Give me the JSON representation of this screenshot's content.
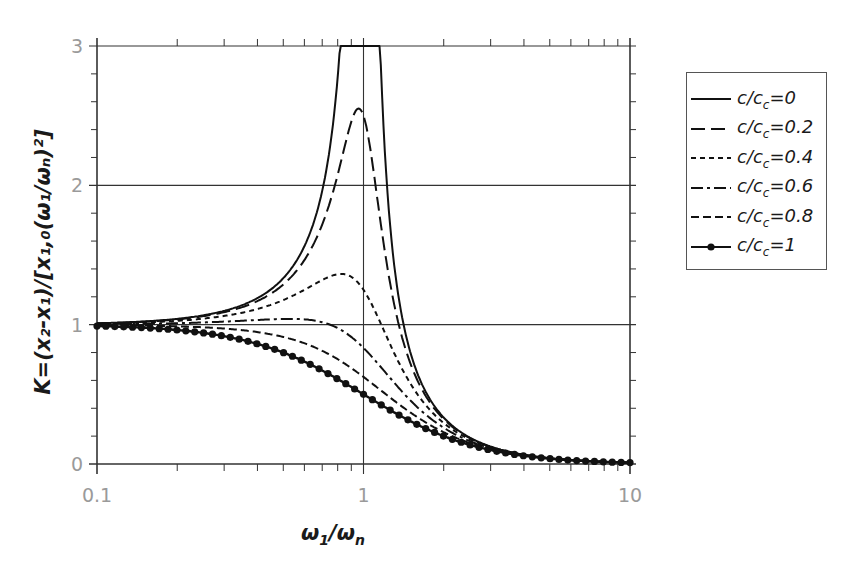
{
  "chart_data": {
    "type": "line",
    "title": "",
    "xlabel": "ω1/ωn",
    "ylabel": "K=(x2-x1)/[x1,0(ω1/ωn)²]",
    "xscale": "log",
    "xlim": [
      0.1,
      10
    ],
    "ylim": [
      0,
      3
    ],
    "xticks": [
      "0.1",
      "1",
      "10"
    ],
    "yticks": [
      "0",
      "1",
      "2",
      "3"
    ],
    "grid": true,
    "legend_position": "right-outside",
    "x": [
      0.1,
      0.15,
      0.2,
      0.3,
      0.4,
      0.5,
      0.6,
      0.7,
      0.8,
      0.85,
      0.9,
      0.95,
      1.0,
      1.05,
      1.1,
      1.2,
      1.3,
      1.5,
      2.0,
      3.0,
      5.0,
      10.0
    ],
    "series": [
      {
        "name": "c/cc=0",
        "style": "solid",
        "values": [
          1.01,
          1.023,
          1.042,
          1.099,
          1.19,
          1.333,
          1.5625,
          1.961,
          2.778,
          3.0,
          3.0,
          3.0,
          3.0,
          3.0,
          3.0,
          2.273,
          1.449,
          0.8,
          0.333,
          0.125,
          0.042,
          0.0101
        ]
      },
      {
        "name": "c/cc=0.2",
        "style": "long-dash",
        "values": [
          1.009,
          1.02,
          1.036,
          1.081,
          1.149,
          1.242,
          1.37,
          1.53,
          1.732,
          1.996,
          2.336,
          2.53,
          2.5,
          2.2,
          1.87,
          1.37,
          1.1,
          0.68,
          0.316,
          0.123,
          0.042,
          0.0101
        ]
      },
      {
        "name": "c/cc=0.4",
        "style": "short-dash",
        "values": [
          1.005,
          1.011,
          1.018,
          1.038,
          1.061,
          1.085,
          1.11,
          1.125,
          1.118,
          1.1,
          1.07,
          1.3,
          1.25,
          1.17,
          1.07,
          0.97,
          0.83,
          0.62,
          0.29,
          0.12,
          0.041,
          0.01
        ]
      },
      {
        "name": "c/cc=0.6",
        "style": "dash-dot",
        "values": [
          1.0,
          0.998,
          0.994,
          0.985,
          0.98,
          0.9,
          0.87,
          0.85,
          0.81,
          0.87,
          0.85,
          0.86,
          0.83,
          0.79,
          0.75,
          0.68,
          0.61,
          0.49,
          0.27,
          0.115,
          0.04,
          0.01
        ]
      },
      {
        "name": "c/cc=0.8",
        "style": "dash-dot-dot",
        "values": [
          0.996,
          0.99,
          0.981,
          0.957,
          0.928,
          0.894,
          0.855,
          0.811,
          0.76,
          0.73,
          0.7,
          0.68,
          0.625,
          0.59,
          0.56,
          0.5,
          0.45,
          0.37,
          0.23,
          0.105,
          0.039,
          0.01
        ]
      },
      {
        "name": "c/cc=1",
        "style": "solid-dots",
        "values": [
          0.99,
          0.978,
          0.962,
          0.917,
          0.862,
          0.8,
          0.735,
          0.671,
          0.61,
          0.581,
          0.552,
          0.526,
          0.5,
          0.476,
          0.452,
          0.41,
          0.372,
          0.308,
          0.2,
          0.1,
          0.038,
          0.0099
        ]
      }
    ],
    "model": "K = 1/sqrt((1-r^2)^2 + (2*zeta*r)^2), clipped at 3"
  },
  "axes": {
    "x_title_main": "ω",
    "x_title_sub1": "1",
    "x_title_slash": "/ω",
    "x_title_sub2": "n",
    "y_title": "K=(x₂-x₁)/[x₁,₀(ω₁/ωₙ)²]",
    "x_tick_labels": [
      "0.1",
      "1",
      "10"
    ],
    "y_tick_labels": [
      "0",
      "1",
      "2",
      "3"
    ]
  },
  "legend": {
    "items": [
      {
        "prefix": "c/c",
        "sub": "c",
        "suffix": "=0",
        "zeta": 0,
        "dash": "",
        "dots": false
      },
      {
        "prefix": "c/c",
        "sub": "c",
        "suffix": "=0.2",
        "zeta": 0.2,
        "dash": "14 6",
        "dots": false
      },
      {
        "prefix": "c/c",
        "sub": "c",
        "suffix": "=0.4",
        "zeta": 0.4,
        "dash": "5 4",
        "dots": false
      },
      {
        "prefix": "c/c",
        "sub": "c",
        "suffix": "=0.6",
        "zeta": 0.6,
        "dash": "12 4 3 4",
        "dots": false
      },
      {
        "prefix": "c/c",
        "sub": "c",
        "suffix": "=0.8",
        "zeta": 0.8,
        "dash": "8 4",
        "dots": false
      },
      {
        "prefix": "c/c",
        "sub": "c",
        "suffix": "=1",
        "zeta": 1.0,
        "dash": "",
        "dots": true
      }
    ]
  },
  "colors": {
    "line": "#111111",
    "grid": "#333333",
    "tick_label": "#9a9a9a"
  }
}
